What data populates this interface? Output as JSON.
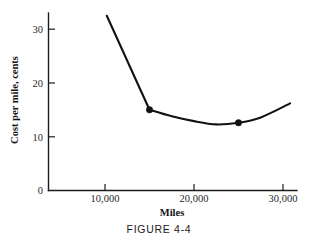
{
  "figure": {
    "caption": "FIGURE 4-4"
  },
  "chart_data": {
    "type": "line",
    "title": "",
    "xlabel": "Miles",
    "ylabel": "Cost per mile, cents",
    "xlim": [
      5000,
      31500
    ],
    "ylim": [
      0,
      33
    ],
    "grid": false,
    "legend": "none",
    "xticks": [
      10000,
      20000,
      30000
    ],
    "xtick_labels": [
      "10,000",
      "20,000",
      "30,000"
    ],
    "yticks": [
      0,
      10,
      20,
      30
    ],
    "ytick_labels": [
      "0",
      "10",
      "20",
      "30"
    ],
    "series": [
      {
        "name": "Cost per mile",
        "x": [
          10200,
          15000,
          17500,
          20000,
          22500,
          25000,
          27500,
          30800
        ],
        "y": [
          32.5,
          15.0,
          13.8,
          12.9,
          12.3,
          12.6,
          13.6,
          16.2
        ]
      }
    ],
    "markers": [
      {
        "x": 15000,
        "y": 15.0,
        "label": ""
      },
      {
        "x": 25000,
        "y": 12.6,
        "label": ""
      }
    ],
    "annotations": []
  }
}
